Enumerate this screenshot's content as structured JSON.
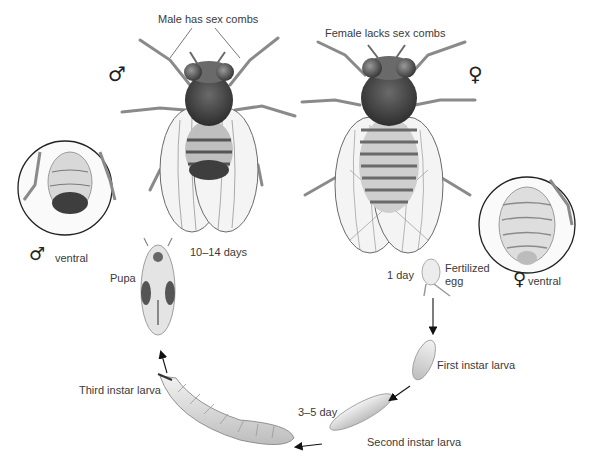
{
  "figure": {
    "adults": {
      "male": {
        "symbol": "♂",
        "caption": "Male has sex combs"
      },
      "female": {
        "symbol": "♀",
        "caption": "Female lacks sex combs"
      }
    },
    "insets": {
      "male_ventral": {
        "symbol": "♂",
        "label": "ventral"
      },
      "female_ventral": {
        "symbol": "♀",
        "label": "ventral"
      }
    },
    "stages": [
      {
        "id": "egg",
        "label": "Fertilized egg",
        "label_lines": [
          "Fertilized",
          "egg"
        ],
        "duration": "1 day"
      },
      {
        "id": "first_instar",
        "label": "First instar larva"
      },
      {
        "id": "second_instar",
        "label": "Second instar larva",
        "duration": "3–5 day"
      },
      {
        "id": "third_instar",
        "label": "Third instar larva"
      },
      {
        "id": "pupa",
        "label": "Pupa",
        "duration": "10–14 days"
      }
    ],
    "colors": {
      "background": "#ffffff",
      "text": "#3a3a3a",
      "line": "#222222",
      "body_dark": "#4a4a4a",
      "body_mid": "#9a9a9a",
      "body_light": "#dcdcdc"
    }
  }
}
